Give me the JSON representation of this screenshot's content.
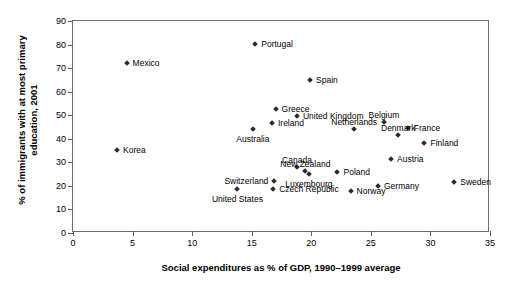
{
  "chart_data": {
    "type": "scatter",
    "title": "",
    "xlabel": "Social expenditures as % of GDP, 1990–1999 average",
    "ylabel": "% of immigrants with at most primary education, 2001",
    "ylabel_line1": "% of immigrants with at most primary",
    "ylabel_line2": "education, 2001",
    "xlim": [
      0,
      35
    ],
    "ylim": [
      0,
      90
    ],
    "xticks": [
      0,
      5,
      10,
      15,
      20,
      25,
      30,
      35
    ],
    "yticks": [
      0,
      10,
      20,
      30,
      40,
      50,
      60,
      70,
      80,
      90
    ],
    "grid": false,
    "legend": "none",
    "marker": "diamond",
    "marker_color": "#2b2b2b",
    "points": [
      {
        "label": "Mexico",
        "x": 4.5,
        "y": 72.0,
        "pos": "right"
      },
      {
        "label": "Korea",
        "x": 3.7,
        "y": 35.1,
        "pos": "right"
      },
      {
        "label": "Portugal",
        "x": 15.3,
        "y": 80.1,
        "pos": "right"
      },
      {
        "label": "Spain",
        "x": 19.9,
        "y": 65.0,
        "pos": "right"
      },
      {
        "label": "Greece",
        "x": 17.0,
        "y": 52.6,
        "pos": "right"
      },
      {
        "label": "United Kingdom",
        "x": 18.8,
        "y": 49.7,
        "pos": "right"
      },
      {
        "label": "Ireland",
        "x": 16.7,
        "y": 46.7,
        "pos": "right"
      },
      {
        "label": "Australia",
        "x": 15.1,
        "y": 44.2,
        "pos": "below"
      },
      {
        "label": "Netherlands",
        "x": 23.6,
        "y": 44.2,
        "pos": "above"
      },
      {
        "label": "Belgium",
        "x": 26.1,
        "y": 47.1,
        "pos": "above"
      },
      {
        "label": "France",
        "x": 28.1,
        "y": 44.6,
        "pos": "right"
      },
      {
        "label": "Denmark",
        "x": 27.3,
        "y": 41.6,
        "pos": "above"
      },
      {
        "label": "Finland",
        "x": 29.5,
        "y": 38.2,
        "pos": "right"
      },
      {
        "label": "Austria",
        "x": 26.7,
        "y": 31.4,
        "pos": "right"
      },
      {
        "label": "Canada",
        "x": 18.8,
        "y": 28.0,
        "pos": "above"
      },
      {
        "label": "New Zealand",
        "x": 19.5,
        "y": 26.3,
        "pos": "above"
      },
      {
        "label": "Poland",
        "x": 22.2,
        "y": 25.9,
        "pos": "right"
      },
      {
        "label": "Switzerland",
        "x": 16.9,
        "y": 22.1,
        "pos": "left"
      },
      {
        "label": "Luxembourg",
        "x": 19.8,
        "y": 25.0,
        "pos": "below"
      },
      {
        "label": "Czech Republic",
        "x": 16.8,
        "y": 18.7,
        "pos": "right"
      },
      {
        "label": "United States",
        "x": 13.8,
        "y": 18.7,
        "pos": "below"
      },
      {
        "label": "Norway",
        "x": 23.3,
        "y": 17.8,
        "pos": "right"
      },
      {
        "label": "Germany",
        "x": 25.6,
        "y": 19.9,
        "pos": "right"
      },
      {
        "label": "Sweden",
        "x": 32.0,
        "y": 21.6,
        "pos": "right"
      }
    ]
  }
}
